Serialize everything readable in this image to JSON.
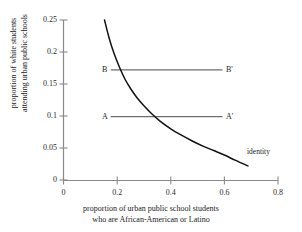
{
  "chart_data": {
    "type": "line",
    "title": "",
    "xlabel_line1": "proportion of urban public school students",
    "xlabel_line2": "who are African-American or Latino",
    "ylabel_line1": "proportion of white students",
    "ylabel_line2": "attending urban public schools",
    "xlim": [
      0,
      0.8
    ],
    "ylim": [
      0,
      0.25
    ],
    "xticks": [
      0,
      0.2,
      0.4,
      0.6,
      0.8
    ],
    "xtick_labels": [
      "0",
      "0.2",
      "0.4",
      "0.6",
      "0.8"
    ],
    "yticks": [
      0,
      0.05,
      0.1,
      0.15,
      0.2,
      0.25
    ],
    "ytick_labels": [
      "0",
      "0.05",
      "0.1",
      "0.15",
      "0.2",
      "0.25"
    ],
    "grid": false,
    "legend": "none",
    "series": [
      {
        "name": "identity",
        "kind": "curve",
        "annotation": "identity",
        "annotation_x": 0.69,
        "annotation_y": 0.045,
        "x": [
          0.153,
          0.17,
          0.19,
          0.21,
          0.23,
          0.25,
          0.275,
          0.3,
          0.33,
          0.36,
          0.4,
          0.44,
          0.48,
          0.52,
          0.56,
          0.6,
          0.64,
          0.688
        ],
        "y": [
          0.25,
          0.222,
          0.196,
          0.175,
          0.157,
          0.143,
          0.128,
          0.116,
          0.103,
          0.092,
          0.08,
          0.07,
          0.061,
          0.053,
          0.046,
          0.039,
          0.031,
          0.022
        ]
      },
      {
        "name": "B-Bprime",
        "kind": "horizontal-line",
        "y": 0.172,
        "x_start": 0.176,
        "x_end": 0.593,
        "label_left": "B",
        "label_right": "B'"
      },
      {
        "name": "A-Aprime",
        "kind": "horizontal-line",
        "y": 0.099,
        "x_start": 0.176,
        "x_end": 0.593,
        "label_left": "A",
        "label_right": "A'"
      }
    ],
    "colors": {
      "axis": "#808080",
      "curve": "#111111",
      "reference_line": "#6e6e6e",
      "text": "#1a1a1a",
      "background": "#ffffff"
    }
  }
}
